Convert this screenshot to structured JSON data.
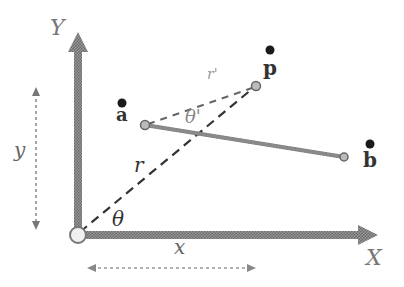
{
  "diagram": {
    "title": "",
    "axes": {
      "x_label": "X",
      "y_label": "Y",
      "color": "#7a7a7a"
    },
    "dimensions": {
      "x_label": "x",
      "y_label": "y"
    },
    "angles": {
      "theta": "θ",
      "theta_prime": "θ'"
    },
    "radii": {
      "r": "r",
      "r_prime": "r'"
    },
    "points": {
      "a": "a",
      "b": "b",
      "p": "p"
    },
    "colors": {
      "axis": "#7d7d7d",
      "segment": "#8a8a8a",
      "dashed": "#333333",
      "dim_arrow": "#888888",
      "point": "#1a1a1a",
      "label": "#444444",
      "origin_fill": "#f0f0f0"
    }
  }
}
